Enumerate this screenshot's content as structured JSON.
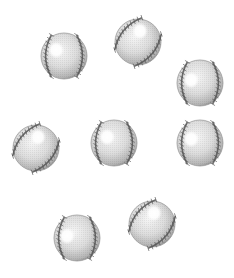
{
  "scene": {
    "description": "Eight baseballs scattered on a white background",
    "background_color": "#ffffff",
    "object_type": "baseball",
    "count": 8,
    "colors": {
      "ball_light": "#f4f4f4",
      "ball_mid": "#d6d6d6",
      "ball_dark": "#9a9a9a",
      "seam": "#555555",
      "highlight": "#ffffff"
    },
    "balls": [
      {
        "id": "ball-1",
        "seam_orientation": "vertical",
        "highlight": "upper-left"
      },
      {
        "id": "ball-2",
        "seam_orientation": "diagonal",
        "highlight": "top"
      },
      {
        "id": "ball-3",
        "seam_orientation": "vertical",
        "highlight": "left"
      },
      {
        "id": "ball-4",
        "seam_orientation": "diagonal",
        "highlight": "top"
      },
      {
        "id": "ball-5",
        "seam_orientation": "vertical",
        "highlight": "upper-left"
      },
      {
        "id": "ball-6",
        "seam_orientation": "vertical",
        "highlight": "left"
      },
      {
        "id": "ball-7",
        "seam_orientation": "vertical",
        "highlight": "left"
      },
      {
        "id": "ball-8",
        "seam_orientation": "diagonal",
        "highlight": "top"
      }
    ]
  }
}
